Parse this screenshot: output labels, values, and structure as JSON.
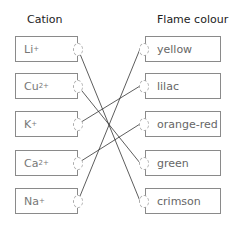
{
  "headers": {
    "left": "Cation",
    "right": "Flame colour"
  },
  "cations": [
    {
      "base": "Li",
      "charge": "+"
    },
    {
      "base": "Cu",
      "charge": "2+"
    },
    {
      "base": "K",
      "charge": "+"
    },
    {
      "base": "Ca",
      "charge": "2+"
    },
    {
      "base": "Na",
      "charge": "+"
    }
  ],
  "colours": [
    "yellow",
    "lilac",
    "orange-red",
    "green",
    "crimson"
  ],
  "connections": [
    {
      "cation": "Li+",
      "colour": "crimson"
    },
    {
      "cation": "Cu2+",
      "colour": "green"
    },
    {
      "cation": "K+",
      "colour": "lilac"
    },
    {
      "cation": "Ca2+",
      "colour": "orange-red"
    },
    {
      "cation": "Na+",
      "colour": "yellow"
    }
  ],
  "line_color": "#333333"
}
